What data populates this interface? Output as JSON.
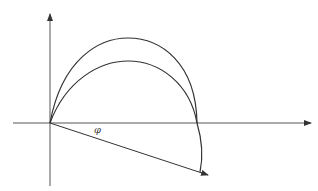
{
  "diagram": {
    "angle_label": "φ",
    "colors": {
      "stroke": "#333333",
      "axis": "#555555",
      "background": "#ffffff"
    }
  }
}
